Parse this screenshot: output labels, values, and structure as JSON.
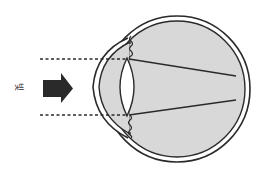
{
  "diagram": {
    "light_label": "빛",
    "colors": {
      "stroke": "#2a2a2a",
      "fill_eye": "#d8d8d8",
      "lens_fill": "#ffffff",
      "arrow": "#2a2a2a"
    },
    "elements": {
      "incoming_arrow": "arrow-right-icon",
      "ray_lines": 2,
      "focal_point": "behind-retina"
    }
  }
}
